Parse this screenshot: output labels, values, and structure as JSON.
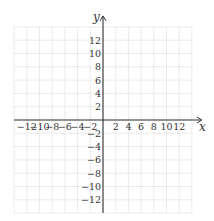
{
  "chart_data": {
    "type": "scatter",
    "title": "",
    "xlabel": "x",
    "ylabel": "y",
    "xlim": [
      -14,
      14
    ],
    "ylim": [
      -14,
      14
    ],
    "grid": true,
    "grid_step": 2,
    "x": [],
    "y": [],
    "series": [],
    "xticks": [
      -12,
      -10,
      -8,
      -6,
      -4,
      -2,
      2,
      4,
      6,
      8,
      10,
      12
    ],
    "yticks": [
      12,
      10,
      8,
      6,
      4,
      2,
      -2,
      -4,
      -6,
      -8,
      -10,
      -12
    ],
    "legend": null
  },
  "layout": {
    "origin_px": [
      103,
      120
    ],
    "unit_px_x": 6.35,
    "unit_px_y": 6.65,
    "grid_color": "#d9d9d9",
    "axis_color": "#333333"
  }
}
